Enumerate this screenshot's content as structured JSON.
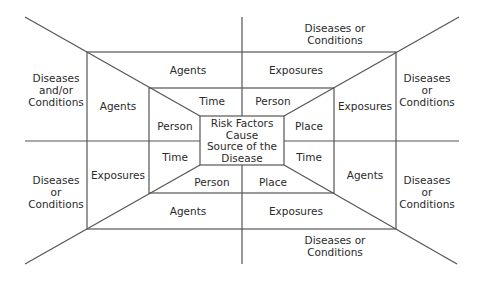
{
  "diagram": {
    "center": "Risk Factors\nCause\nSource of the\nDisease",
    "center_lines": [
      "Risk Factors",
      "Cause",
      "Source of the",
      "Disease"
    ],
    "top_outer": [
      "Diseases or",
      "Conditions"
    ],
    "bottom_outer": [
      "Diseases or",
      "Conditions"
    ],
    "left_outer_top": [
      "Diseases",
      "and/or",
      "Conditions"
    ],
    "left_outer_bottom": [
      "Diseases",
      "or",
      "Conditions"
    ],
    "right_outer_top": [
      "Diseases",
      "or",
      "Conditions"
    ],
    "right_outer_bottom": [
      "Diseases",
      "or",
      "Conditions"
    ],
    "ring1": {
      "top_left": "Agents",
      "top_right": "Exposures",
      "left_top": "Agents",
      "left_bottom": "Exposures",
      "right_top": "Exposures",
      "right_bottom": "Agents",
      "bottom_left": "Agents",
      "bottom_right": "Exposures"
    },
    "ring2": {
      "top_left": "Time",
      "top_right": "Person",
      "left_top": "Person",
      "left_bottom": "Time",
      "right_top": "Place",
      "right_bottom": "Time",
      "bottom_left": "Person",
      "bottom_right": "Place"
    },
    "line_color": "#555555",
    "text_color": "#2a2a2a"
  }
}
